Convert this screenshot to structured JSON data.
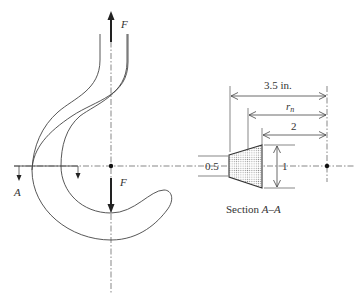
{
  "figure": {
    "hook": {
      "force_top_label": "F",
      "force_bottom_label": "F",
      "section_marker_label": "A"
    },
    "section": {
      "caption_prefix": "Section ",
      "caption_section": "A–A",
      "dimensions": {
        "overall_radius": "3.5 in.",
        "neutral_axis_radius_base": "r",
        "neutral_axis_radius_sub": "n",
        "inner_radius": "2",
        "inner_width": "0.5",
        "height": "1"
      }
    },
    "colors": {
      "line": "#444444",
      "fill_dots": "#9a9a9a"
    }
  }
}
